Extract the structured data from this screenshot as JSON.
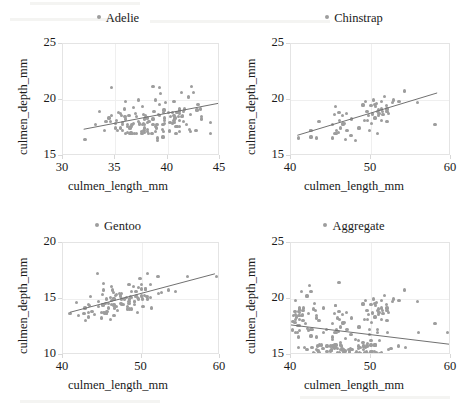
{
  "figure": {
    "layout": "2x2-grid",
    "marker_color": "#9d9d9d",
    "line_color": "#6e6e6e",
    "grid_color": "#efefef",
    "border_color": "#e4e4e4"
  },
  "chart_data": [
    {
      "type": "scatter",
      "title": "Adelie",
      "legend_label": "Adelie",
      "legend_position": "top-center",
      "xlabel": "culmen_length_mm",
      "ylabel": "culmen_depth_mm",
      "xlim": [
        30,
        45
      ],
      "ylim": [
        15,
        25
      ],
      "xticks": [
        30,
        35,
        40,
        45
      ],
      "yticks": [
        15,
        20,
        25
      ],
      "grid": true,
      "trendline": {
        "x": [
          32.0,
          45.0
        ],
        "y": [
          17.25,
          19.6
        ]
      },
      "x": [
        39.1,
        39.5,
        40.3,
        36.7,
        39.3,
        38.9,
        39.2,
        34.1,
        42.0,
        37.8,
        37.8,
        41.1,
        38.6,
        34.6,
        36.6,
        38.7,
        42.5,
        34.4,
        46.0,
        37.8,
        37.7,
        35.9,
        38.2,
        38.8,
        35.3,
        40.6,
        40.5,
        37.9,
        40.5,
        39.5,
        37.2,
        39.5,
        40.9,
        36.4,
        39.2,
        38.8,
        42.2,
        37.6,
        39.8,
        36.5,
        40.8,
        36.0,
        44.1,
        37.0,
        39.6,
        41.1,
        37.5,
        36.0,
        42.3,
        39.6,
        40.1,
        35.0,
        42.0,
        34.5,
        41.4,
        39.0,
        40.6,
        36.5,
        37.6,
        35.7,
        41.3,
        37.6,
        41.1,
        36.4,
        41.6,
        35.5,
        41.1,
        35.9,
        41.8,
        33.5,
        39.7,
        39.6,
        45.8,
        35.5,
        42.8,
        40.9,
        37.2,
        36.2,
        42.1,
        34.6,
        42.9,
        36.7,
        35.1,
        37.3,
        41.3,
        36.3,
        36.9,
        38.3,
        38.9,
        35.7,
        41.1,
        34.0,
        39.6,
        36.2,
        40.8,
        38.1,
        40.3,
        33.1,
        43.2,
        35.0,
        41.0,
        37.7,
        37.8,
        37.9,
        39.7,
        38.6,
        38.2,
        38.1,
        43.2,
        38.1,
        45.6,
        39.7,
        42.2,
        39.6,
        42.7,
        38.6,
        37.3,
        35.7,
        41.1,
        36.2,
        37.7,
        40.2,
        41.4,
        35.2,
        40.6,
        38.8,
        41.5,
        39.0,
        44.1,
        38.5,
        43.1,
        36.8,
        37.5,
        38.1,
        41.1,
        35.6,
        40.2,
        37.0,
        39.7,
        40.2,
        40.6,
        32.1,
        40.7,
        37.3,
        39.0,
        39.2,
        36.6,
        36.0,
        37.8,
        36.0,
        41.5
      ],
      "y": [
        18.7,
        17.4,
        18.0,
        19.3,
        20.6,
        17.8,
        19.6,
        18.1,
        20.2,
        17.1,
        17.3,
        17.6,
        21.2,
        21.1,
        17.8,
        19.0,
        20.7,
        18.4,
        21.5,
        18.3,
        18.7,
        19.2,
        18.1,
        17.2,
        18.9,
        18.6,
        17.9,
        18.6,
        18.9,
        16.7,
        18.1,
        17.8,
        18.9,
        17.0,
        21.1,
        20.0,
        18.7,
        19.4,
        19.8,
        17.1,
        17.0,
        19.9,
        17.0,
        18.5,
        17.2,
        17.2,
        17.0,
        18.3,
        21.2,
        16.7,
        18.9,
        17.9,
        20.3,
        18.1,
        18.6,
        16.6,
        19.9,
        17.6,
        17.8,
        18.0,
        20.7,
        17.0,
        18.2,
        17.5,
        19.2,
        17.5,
        18.8,
        18.5,
        17.8,
        19.0,
        18.4,
        18.9,
        18.3,
        18.8,
        19.1,
        17.6,
        20.0,
        17.1,
        17.4,
        18.6,
        19.6,
        17.9,
        18.2,
        17.8,
        18.5,
        18.6,
        18.8,
        18.1,
        17.5,
        17.8,
        19.2,
        17.3,
        17.8,
        17.6,
        17.6,
        18.4,
        18.5,
        17.8,
        18.3,
        17.5,
        18.5,
        17.3,
        17.5,
        18.4,
        19.1,
        17.8,
        17.0,
        18.0,
        18.5,
        17.2,
        19.4,
        17.9,
        17.2,
        19.1,
        17.3,
        18.3,
        17.9,
        17.3,
        19.1,
        17.8,
        17.9,
        18.0,
        18.5,
        17.3,
        18.2,
        17.6,
        18.1,
        16.4,
        18.0,
        17.0,
        19.2,
        17.0,
        17.2,
        17.4,
        19.0,
        18.6,
        17.2,
        17.0,
        18.2,
        17.3,
        18.0,
        16.5,
        18.4,
        17.9,
        17.8,
        18.6,
        17.0,
        18.5,
        17.8,
        17.0,
        19.0
      ]
    },
    {
      "type": "scatter",
      "title": "Chinstrap",
      "legend_label": "Chinstrap",
      "legend_position": "top-center",
      "xlabel": "culmen_length_mm",
      "ylabel": "culmen_depth_mm",
      "xlim": [
        40,
        60
      ],
      "ylim": [
        15,
        25
      ],
      "xticks": [
        40,
        50,
        60
      ],
      "yticks": [
        15,
        20,
        25
      ],
      "grid": true,
      "trendline": {
        "x": [
          40.8,
          58.5
        ],
        "y": [
          16.7,
          20.55
        ]
      },
      "x": [
        46.5,
        50.0,
        51.3,
        45.4,
        52.7,
        45.2,
        46.1,
        51.3,
        46.0,
        51.3,
        46.6,
        51.7,
        47.0,
        52.0,
        45.9,
        50.5,
        50.3,
        58.0,
        46.4,
        49.2,
        42.4,
        48.5,
        43.2,
        50.6,
        46.7,
        52.0,
        50.5,
        49.5,
        46.4,
        52.8,
        40.9,
        54.2,
        42.5,
        51.0,
        49.7,
        47.5,
        47.6,
        52.0,
        46.9,
        53.5,
        49.0,
        46.2,
        50.9,
        45.5,
        50.9,
        50.8,
        50.1,
        49.0,
        51.5,
        49.8,
        48.1,
        51.4,
        45.7,
        50.7,
        42.5,
        52.2,
        45.2,
        49.3,
        50.2,
        45.6,
        51.9,
        46.8,
        45.7,
        55.8,
        43.5,
        49.6,
        50.8,
        50.2
      ],
      "y": [
        17.9,
        19.5,
        19.2,
        18.7,
        19.8,
        17.8,
        18.2,
        18.2,
        18.9,
        19.9,
        17.8,
        20.3,
        17.3,
        18.1,
        17.1,
        19.6,
        20.0,
        17.8,
        18.6,
        18.2,
        17.3,
        17.5,
        16.6,
        19.4,
        17.9,
        19.0,
        18.4,
        19.0,
        17.8,
        20.0,
        16.6,
        20.8,
        16.7,
        18.8,
        18.6,
        16.8,
        18.3,
        19.2,
        18.8,
        19.9,
        19.5,
        17.5,
        19.1,
        17.0,
        18.6,
        17.0,
        17.9,
        19.6,
        18.7,
        17.3,
        16.4,
        19.0,
        17.3,
        19.7,
        17.3,
        18.8,
        16.6,
        19.9,
        18.8,
        19.4,
        19.5,
        16.5,
        17.0,
        19.8,
        18.1,
        18.2,
        19.0,
        18.7
      ]
    },
    {
      "type": "scatter",
      "title": "Gentoo",
      "legend_label": "Gentoo",
      "legend_position": "top-center",
      "xlabel": "culmen_length_mm",
      "ylabel": "culmen_depth_mm",
      "xlim": [
        40,
        60
      ],
      "ylim": [
        10,
        20
      ],
      "xticks": [
        40,
        50,
        60
      ],
      "yticks": [
        10,
        15,
        20
      ],
      "grid": true,
      "trendline": {
        "x": [
          40.9,
          59.6
        ],
        "y": [
          13.7,
          17.2
        ]
      },
      "x": [
        46.1,
        50.0,
        48.7,
        50.0,
        47.6,
        46.5,
        45.4,
        46.7,
        43.3,
        46.8,
        40.9,
        49.0,
        45.5,
        48.4,
        45.8,
        49.3,
        42.0,
        49.2,
        46.2,
        48.7,
        50.2,
        45.1,
        46.5,
        46.3,
        42.9,
        46.1,
        44.5,
        47.8,
        48.2,
        50.0,
        47.3,
        42.8,
        45.1,
        59.6,
        49.1,
        48.4,
        42.6,
        44.4,
        44.0,
        48.7,
        42.7,
        49.6,
        45.3,
        49.6,
        50.5,
        43.6,
        45.5,
        50.5,
        44.9,
        45.2,
        46.6,
        48.5,
        45.1,
        50.1,
        46.5,
        45.0,
        43.8,
        45.5,
        43.2,
        50.4,
        45.3,
        46.2,
        45.7,
        54.3,
        45.8,
        49.8,
        46.2,
        49.5,
        43.5,
        50.7,
        47.7,
        46.4,
        48.2,
        46.5,
        46.4,
        48.6,
        47.5,
        51.1,
        45.2,
        45.2,
        49.1,
        52.5,
        47.4,
        50.0,
        44.9,
        50.8,
        43.4,
        51.3,
        47.5,
        52.1,
        47.5,
        52.2,
        45.5,
        49.5,
        44.5,
        50.8,
        49.4,
        46.9,
        48.4,
        51.1,
        48.5,
        55.9,
        47.2,
        49.1,
        47.3,
        46.8,
        41.7,
        53.4,
        43.3,
        48.1
      ],
      "y": [
        13.2,
        16.3,
        14.1,
        15.2,
        14.5,
        13.5,
        14.6,
        15.3,
        13.4,
        15.4,
        13.7,
        16.1,
        13.7,
        14.6,
        14.6,
        15.7,
        13.5,
        15.2,
        14.5,
        15.1,
        14.3,
        14.5,
        14.5,
        15.8,
        13.1,
        15.1,
        14.3,
        15.0,
        14.3,
        15.3,
        15.3,
        14.2,
        14.5,
        17.0,
        14.8,
        16.3,
        13.7,
        17.3,
        13.6,
        15.7,
        13.7,
        16.0,
        13.7,
        15.0,
        15.9,
        13.9,
        13.9,
        15.9,
        13.3,
        15.8,
        14.2,
        14.1,
        14.4,
        15.0,
        14.4,
        15.4,
        13.9,
        15.0,
        14.5,
        15.3,
        13.8,
        14.9,
        13.9,
        15.7,
        14.2,
        16.8,
        16.1,
        15.1,
        15.2,
        15.2,
        14.5,
        15.6,
        14.1,
        15.0,
        15.0,
        15.2,
        15.5,
        16.3,
        13.8,
        16.4,
        14.5,
        15.6,
        14.6,
        15.9,
        13.8,
        17.3,
        14.4,
        14.2,
        14.5,
        17.0,
        15.0,
        15.5,
        13.7,
        13.8,
        14.8,
        15.0,
        15.3,
        14.0,
        14.8,
        15.1,
        15.0,
        17.0,
        15.5,
        14.8,
        15.2,
        14.3,
        14.7,
        15.8,
        13.8,
        15.1
      ]
    },
    {
      "type": "scatter",
      "title": "Aggregate",
      "legend_label": "Aggregate",
      "legend_position": "top-center",
      "xlabel": "culmen_length_mm",
      "ylabel": "culmen_depth_mm",
      "xlim": [
        40,
        60
      ],
      "ylim": [
        15,
        25
      ],
      "xticks": [
        40,
        50,
        60
      ],
      "yticks": [
        15,
        20,
        25
      ],
      "grid": true,
      "trendline": {
        "x": [
          40.0,
          60.0
        ],
        "y": [
          17.55,
          15.8
        ]
      },
      "note": "combines Adelie, Chinstrap and Gentoo observations; Simpson's paradox — aggregate slope is negative while each group slope is positive",
      "x": [
        40.3,
        42.0,
        41.1,
        42.5,
        46.0,
        40.6,
        40.5,
        40.5,
        40.9,
        42.2,
        40.8,
        44.1,
        41.1,
        42.3,
        42.0,
        41.4,
        40.6,
        41.3,
        41.1,
        41.6,
        41.1,
        41.8,
        45.8,
        42.8,
        40.9,
        42.1,
        42.9,
        41.3,
        41.1,
        40.8,
        40.3,
        43.2,
        41.0,
        43.2,
        45.6,
        42.2,
        42.7,
        41.1,
        40.2,
        41.4,
        40.6,
        41.5,
        44.1,
        43.1,
        41.1,
        40.2,
        40.2,
        40.6,
        40.7,
        41.5,
        46.5,
        50.0,
        51.3,
        45.4,
        52.7,
        45.2,
        46.1,
        51.3,
        46.0,
        51.3,
        46.6,
        51.7,
        47.0,
        52.0,
        45.9,
        50.5,
        50.3,
        58.0,
        46.4,
        49.2,
        42.4,
        48.5,
        43.2,
        50.6,
        46.7,
        52.0,
        50.5,
        49.5,
        46.4,
        52.8,
        40.9,
        54.2,
        42.5,
        51.0,
        49.7,
        47.5,
        47.6,
        52.0,
        46.9,
        53.5,
        49.0,
        46.2,
        50.9,
        45.5,
        50.9,
        50.8,
        50.1,
        49.0,
        51.5,
        49.8,
        48.1,
        51.4,
        45.7,
        50.7,
        42.5,
        52.2,
        45.2,
        49.3,
        50.2,
        45.6,
        51.9,
        46.8,
        45.7,
        55.8,
        43.5,
        49.6,
        50.8,
        50.2,
        46.1,
        50.0,
        48.7,
        50.0,
        47.6,
        46.5,
        45.4,
        46.7,
        43.3,
        46.8,
        40.9,
        49.0,
        45.5,
        48.4,
        45.8,
        49.3,
        42.0,
        49.2,
        46.2,
        48.7,
        50.2,
        45.1,
        46.5,
        46.3,
        42.9,
        46.1,
        44.5,
        47.8,
        48.2,
        50.0,
        47.3,
        42.8,
        45.1,
        59.6,
        49.1,
        48.4,
        42.6,
        44.4,
        44.0,
        48.7,
        42.7,
        49.6,
        45.3,
        49.6,
        50.5,
        43.6,
        45.5,
        50.5,
        44.9,
        45.2,
        46.6,
        48.5,
        45.1,
        50.1,
        46.5,
        45.0,
        43.8,
        45.5,
        43.2,
        50.4,
        45.3,
        46.2,
        45.7,
        54.3,
        45.8,
        49.8,
        46.2,
        49.5,
        43.5,
        50.7,
        47.7,
        46.4,
        48.2,
        46.5,
        46.4,
        48.6,
        47.5,
        51.1,
        45.2,
        45.2,
        49.1,
        52.5,
        47.4,
        50.0,
        44.9,
        50.8,
        43.4,
        51.3,
        47.5,
        52.1,
        47.5,
        52.2,
        45.5,
        49.5,
        44.5,
        50.8,
        49.4,
        46.9,
        48.4,
        51.1,
        48.5,
        55.9,
        47.2,
        49.1,
        47.3,
        46.8,
        41.7,
        53.4,
        43.3,
        48.1
      ],
      "y": [
        18.0,
        20.2,
        17.6,
        20.7,
        21.5,
        18.6,
        17.9,
        18.9,
        18.9,
        18.7,
        17.0,
        17.0,
        17.2,
        21.2,
        20.3,
        18.6,
        19.9,
        20.7,
        18.2,
        19.2,
        18.8,
        17.8,
        18.3,
        19.1,
        17.6,
        17.4,
        19.6,
        18.5,
        19.2,
        17.6,
        18.5,
        18.3,
        18.5,
        18.5,
        19.4,
        17.2,
        17.3,
        19.1,
        18.0,
        18.5,
        18.2,
        18.1,
        19.2,
        19.0,
        19.0,
        17.2,
        17.3,
        17.0,
        18.4,
        19.0,
        17.9,
        19.5,
        19.2,
        18.7,
        19.8,
        17.8,
        18.2,
        18.2,
        18.9,
        19.9,
        17.8,
        20.3,
        17.3,
        18.1,
        17.1,
        19.6,
        20.0,
        17.8,
        18.6,
        18.2,
        17.3,
        17.5,
        16.6,
        19.4,
        17.9,
        19.0,
        18.4,
        19.0,
        17.8,
        20.0,
        16.6,
        20.8,
        16.7,
        18.8,
        18.6,
        16.8,
        18.3,
        19.2,
        18.8,
        19.9,
        19.5,
        17.5,
        19.1,
        17.0,
        18.6,
        17.0,
        17.9,
        19.6,
        18.7,
        17.3,
        16.4,
        19.0,
        17.3,
        19.7,
        17.3,
        18.8,
        16.6,
        19.9,
        18.8,
        19.4,
        19.5,
        16.5,
        17.0,
        19.8,
        18.1,
        18.2,
        19.0,
        18.7,
        15.2,
        16.3,
        15.1,
        15.2,
        15.5,
        15.5,
        15.6,
        15.3,
        15.4,
        15.4,
        15.7,
        16.1,
        15.7,
        15.6,
        15.6,
        15.7,
        15.5,
        15.2,
        15.5,
        15.1,
        15.3,
        15.5,
        15.5,
        15.8,
        15.1,
        15.1,
        15.3,
        15.0,
        15.3,
        15.3,
        15.3,
        15.2,
        15.5,
        17.0,
        15.8,
        16.3,
        15.7,
        17.3,
        15.6,
        15.7,
        15.7,
        16.0,
        15.7,
        15.0,
        15.9,
        15.9,
        15.9,
        15.9,
        15.3,
        15.8,
        15.2,
        15.1,
        15.4,
        15.0,
        15.4,
        15.4,
        15.9,
        15.0,
        15.5,
        15.3,
        15.8,
        15.9,
        15.9,
        15.7,
        15.2,
        16.8,
        16.1,
        15.1,
        15.2,
        15.2,
        15.5,
        15.6,
        15.1,
        15.0,
        15.0,
        15.2,
        15.5,
        16.3,
        15.8,
        16.4,
        15.5,
        15.6,
        15.6,
        15.9,
        15.8,
        17.3,
        15.4,
        15.2,
        15.5,
        17.0,
        15.0,
        15.5,
        15.7,
        15.8,
        15.8,
        15.0,
        15.3,
        15.0,
        15.8,
        15.1,
        15.0,
        17.0,
        15.5,
        15.8,
        15.2,
        15.3,
        15.7,
        15.8,
        15.8,
        15.1
      ]
    }
  ]
}
